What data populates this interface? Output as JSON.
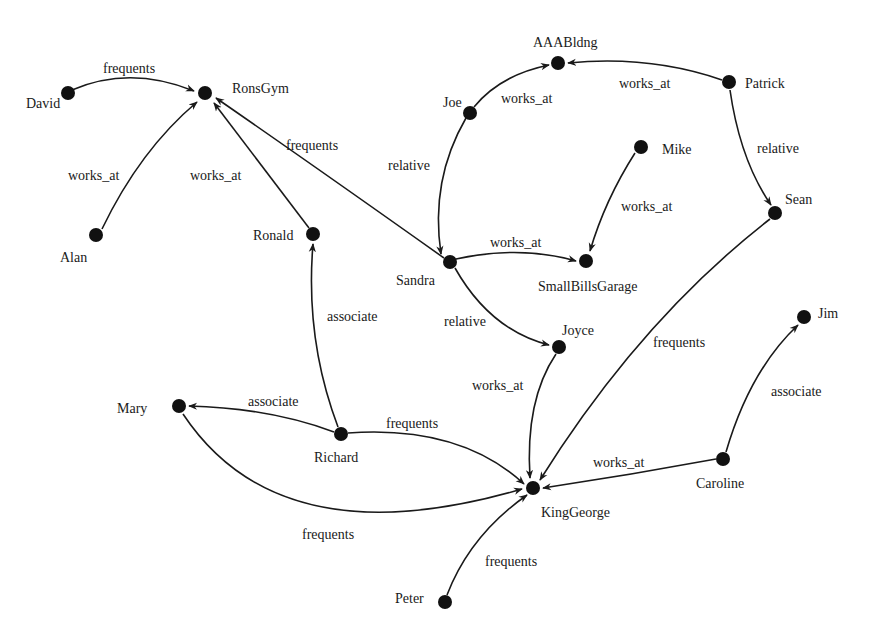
{
  "diagram": {
    "type": "directed-graph",
    "colors": {
      "ink": "#1a1a1a",
      "node": "#111111",
      "background": "#ffffff"
    },
    "nodes": [
      {
        "id": "David",
        "label": "David",
        "x": 68,
        "y": 93,
        "lx": 26,
        "ly": 108,
        "anchor": "start"
      },
      {
        "id": "RonsGym",
        "label": "RonsGym",
        "x": 205,
        "y": 93,
        "lx": 232,
        "ly": 93,
        "anchor": "start"
      },
      {
        "id": "Alan",
        "label": "Alan",
        "x": 96,
        "y": 235,
        "lx": 60,
        "ly": 262,
        "anchor": "start"
      },
      {
        "id": "Ronald",
        "label": "Ronald",
        "x": 313,
        "y": 234,
        "lx": 253,
        "ly": 240,
        "anchor": "start"
      },
      {
        "id": "Joe",
        "label": "Joe",
        "x": 470,
        "y": 113,
        "lx": 443,
        "ly": 107,
        "anchor": "start"
      },
      {
        "id": "AAABldng",
        "label": "AAABldng",
        "x": 558,
        "y": 63,
        "lx": 533,
        "ly": 47,
        "anchor": "start"
      },
      {
        "id": "Patrick",
        "label": "Patrick",
        "x": 729,
        "y": 82,
        "lx": 745,
        "ly": 88,
        "anchor": "start"
      },
      {
        "id": "Mike",
        "label": "Mike",
        "x": 641,
        "y": 147,
        "lx": 662,
        "ly": 154,
        "anchor": "start"
      },
      {
        "id": "Sean",
        "label": "Sean",
        "x": 775,
        "y": 213,
        "lx": 785,
        "ly": 204,
        "anchor": "start"
      },
      {
        "id": "Sandra",
        "label": "Sandra",
        "x": 450,
        "y": 262,
        "lx": 396,
        "ly": 285,
        "anchor": "start"
      },
      {
        "id": "SmallBillsGarage",
        "label": "SmallBillsGarage",
        "x": 586,
        "y": 261,
        "lx": 538,
        "ly": 291,
        "anchor": "start"
      },
      {
        "id": "Joyce",
        "label": "Joyce",
        "x": 559,
        "y": 347,
        "lx": 562,
        "ly": 335,
        "anchor": "start"
      },
      {
        "id": "Jim",
        "label": "Jim",
        "x": 804,
        "y": 317,
        "lx": 818,
        "ly": 318,
        "anchor": "start"
      },
      {
        "id": "Mary",
        "label": "Mary",
        "x": 179,
        "y": 406,
        "lx": 117,
        "ly": 413,
        "anchor": "start"
      },
      {
        "id": "Richard",
        "label": "Richard",
        "x": 341,
        "y": 434,
        "lx": 314,
        "ly": 462,
        "anchor": "start"
      },
      {
        "id": "KingGeorge",
        "label": "KingGeorge",
        "x": 533,
        "y": 488,
        "lx": 541,
        "ly": 517,
        "anchor": "start"
      },
      {
        "id": "Caroline",
        "label": "Caroline",
        "x": 723,
        "y": 459,
        "lx": 696,
        "ly": 488,
        "anchor": "start"
      },
      {
        "id": "Peter",
        "label": "Peter",
        "x": 445,
        "y": 602,
        "lx": 395,
        "ly": 603,
        "anchor": "start"
      }
    ],
    "edges": [
      {
        "from": "David",
        "to": "RonsGym",
        "label": "frequents",
        "path": "M 72 90 Q 130 65 194 91",
        "lx": 103,
        "ly": 73
      },
      {
        "from": "Alan",
        "to": "RonsGym",
        "label": "works_at",
        "path": "M 102 229 Q 140 150 197 102",
        "lx": 68,
        "ly": 180
      },
      {
        "from": "Ronald",
        "to": "RonsGym",
        "label": "works_at",
        "path": "M 309 228 L 214 103",
        "lx": 190,
        "ly": 180
      },
      {
        "from": "Sandra",
        "to": "RonsGym",
        "label": "frequents",
        "path": "M 444 258 Q 320 170 216 98",
        "lx": 286,
        "ly": 150
      },
      {
        "from": "Joe",
        "to": "AAABldng",
        "label": "works_at",
        "path": "M 474 107 Q 500 75 549 65",
        "lx": 501,
        "ly": 103
      },
      {
        "from": "Patrick",
        "to": "AAABldng",
        "label": "works_at",
        "path": "M 722 80 Q 650 55 568 63",
        "lx": 619,
        "ly": 88
      },
      {
        "from": "Joe",
        "to": "Sandra",
        "label": "relative",
        "path": "M 466 118 Q 430 180 441 254",
        "lx": 388,
        "ly": 170
      },
      {
        "from": "Patrick",
        "to": "Sean",
        "label": "relative",
        "path": "M 730 90 Q 740 160 771 205",
        "lx": 757,
        "ly": 153
      },
      {
        "from": "Mike",
        "to": "SmallBillsGarage",
        "label": "works_at",
        "path": "M 635 153 Q 605 200 590 251",
        "lx": 621,
        "ly": 211
      },
      {
        "from": "Sandra",
        "to": "SmallBillsGarage",
        "label": "works_at",
        "path": "M 456 259 Q 520 245 576 261",
        "lx": 490,
        "ly": 247
      },
      {
        "from": "Sandra",
        "to": "Joyce",
        "label": "relative",
        "path": "M 455 268 Q 490 330 549 345",
        "lx": 444,
        "ly": 326
      },
      {
        "from": "Richard",
        "to": "Ronald",
        "label": "associate",
        "path": "M 338 427 Q 305 340 313 244",
        "lx": 327,
        "ly": 321
      },
      {
        "from": "Richard",
        "to": "Mary",
        "label": "associate",
        "path": "M 334 432 Q 270 408 189 406",
        "lx": 248,
        "ly": 406
      },
      {
        "from": "Richard",
        "to": "KingGeorge",
        "label": "frequents",
        "path": "M 348 433 Q 460 425 524 484",
        "lx": 386,
        "ly": 428
      },
      {
        "from": "Mary",
        "to": "KingGeorge",
        "label": "frequents",
        "path": "M 183 414 Q 280 560 522 489",
        "lx": 302,
        "ly": 539
      },
      {
        "from": "Joyce",
        "to": "KingGeorge",
        "label": "works_at",
        "path": "M 556 354 Q 525 400 530 478",
        "lx": 472,
        "ly": 390
      },
      {
        "from": "Sean",
        "to": "KingGeorge",
        "label": "frequents",
        "path": "M 770 219 Q 640 320 540 480",
        "lx": 653,
        "ly": 347
      },
      {
        "from": "Caroline",
        "to": "KingGeorge",
        "label": "works_at",
        "path": "M 716 459 Q 630 475 543 488",
        "lx": 593,
        "ly": 467
      },
      {
        "from": "Caroline",
        "to": "Jim",
        "label": "associate",
        "path": "M 726 452 Q 750 370 798 325",
        "lx": 771,
        "ly": 396
      },
      {
        "from": "Peter",
        "to": "KingGeorge",
        "label": "frequents",
        "path": "M 447 595 Q 470 535 527 495",
        "lx": 485,
        "ly": 566
      }
    ]
  }
}
